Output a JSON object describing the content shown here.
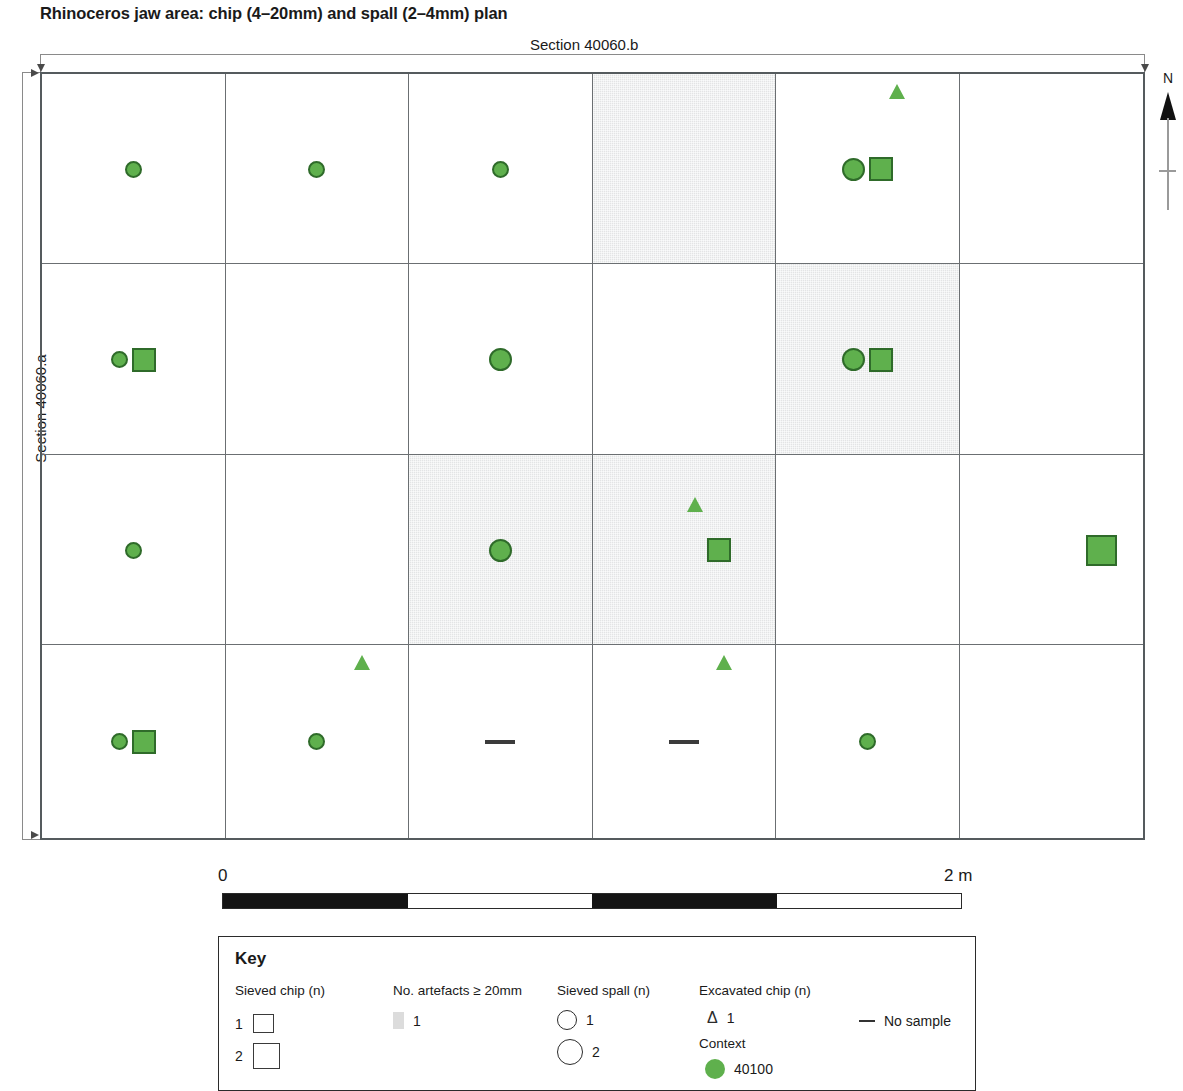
{
  "title": "Rhinoceros jaw area: chip (4–20mm) and spall (2–4mm) plan",
  "section_top_label": "Section 40060.b",
  "section_left_label": "Section 40060.a",
  "north": {
    "label": "N",
    "icon": "north-arrow-icon"
  },
  "scale": {
    "min_label": "0",
    "max_label": "2 m",
    "segments": [
      "dark",
      "light",
      "dark",
      "light"
    ]
  },
  "colors": {
    "context_green": "#5fb04d",
    "symbol_outline": "#2f6b2a",
    "shaded_cell": "#e3e4e5",
    "grid_line": "#6b6f72"
  },
  "chart_data": {
    "type": "table",
    "title": "Rhinoceros jaw area: chip (4–20mm) and spall (2–4mm) plan",
    "xlabel": "Section 40060.b",
    "ylabel": "Section 40060.a",
    "grid": {
      "rows": 4,
      "cols": 6
    },
    "legend_position": "bottom",
    "cells": [
      {
        "row": 1,
        "col": 1,
        "shaded": false,
        "symbols": [
          "circle-n1"
        ]
      },
      {
        "row": 1,
        "col": 2,
        "shaded": false,
        "symbols": [
          "circle-n1"
        ]
      },
      {
        "row": 1,
        "col": 3,
        "shaded": false,
        "symbols": [
          "circle-n1"
        ]
      },
      {
        "row": 1,
        "col": 4,
        "shaded": true,
        "symbols": []
      },
      {
        "row": 1,
        "col": 5,
        "shaded": false,
        "symbols": [
          "circle-n2",
          "square-n2",
          "triangle-n1"
        ]
      },
      {
        "row": 1,
        "col": 6,
        "shaded": false,
        "symbols": []
      },
      {
        "row": 2,
        "col": 1,
        "shaded": false,
        "symbols": [
          "circle-n1",
          "square-n2"
        ]
      },
      {
        "row": 2,
        "col": 2,
        "shaded": false,
        "symbols": []
      },
      {
        "row": 2,
        "col": 3,
        "shaded": false,
        "symbols": [
          "circle-n2"
        ]
      },
      {
        "row": 2,
        "col": 4,
        "shaded": false,
        "symbols": []
      },
      {
        "row": 2,
        "col": 5,
        "shaded": true,
        "symbols": [
          "circle-n2",
          "square-n2"
        ]
      },
      {
        "row": 2,
        "col": 6,
        "shaded": false,
        "symbols": []
      },
      {
        "row": 3,
        "col": 1,
        "shaded": false,
        "symbols": [
          "circle-n1"
        ]
      },
      {
        "row": 3,
        "col": 2,
        "shaded": false,
        "symbols": []
      },
      {
        "row": 3,
        "col": 3,
        "shaded": true,
        "symbols": [
          "circle-n2"
        ]
      },
      {
        "row": 3,
        "col": 4,
        "shaded": true,
        "symbols": [
          "triangle-n1",
          "square-n2"
        ]
      },
      {
        "row": 3,
        "col": 5,
        "shaded": false,
        "symbols": []
      },
      {
        "row": 3,
        "col": 6,
        "shaded": false,
        "symbols": [
          "square-n3"
        ]
      },
      {
        "row": 4,
        "col": 1,
        "shaded": false,
        "symbols": [
          "circle-n1",
          "square-n2"
        ]
      },
      {
        "row": 4,
        "col": 2,
        "shaded": false,
        "symbols": [
          "triangle-n1",
          "circle-n1"
        ]
      },
      {
        "row": 4,
        "col": 3,
        "shaded": false,
        "symbols": [
          "dash-no-sample"
        ]
      },
      {
        "row": 4,
        "col": 4,
        "shaded": false,
        "symbols": [
          "triangle-n1",
          "dash-no-sample"
        ]
      },
      {
        "row": 4,
        "col": 5,
        "shaded": false,
        "symbols": [
          "circle-n1"
        ]
      },
      {
        "row": 4,
        "col": 6,
        "shaded": false,
        "symbols": []
      }
    ]
  },
  "key": {
    "title": "Key",
    "columns": [
      {
        "header": "Sieved chip (n)",
        "items": [
          {
            "label": "1",
            "symbol": "open-square-small"
          },
          {
            "label": "2",
            "symbol": "open-square-large"
          }
        ]
      },
      {
        "header": "No. artefacts ≥ 20mm",
        "items": [
          {
            "label": "1",
            "symbol": "grey-swatch"
          }
        ]
      },
      {
        "header": "Sieved spall (n)",
        "items": [
          {
            "label": "1",
            "symbol": "open-circle-small"
          },
          {
            "label": "2",
            "symbol": "open-circle-large"
          }
        ]
      },
      {
        "header": "Excavated chip (n)",
        "items": [
          {
            "label": "1",
            "symbol": "open-triangle"
          }
        ],
        "sub_header": "Context",
        "sub_items": [
          {
            "label": "40100",
            "symbol": "green-circle"
          }
        ]
      },
      {
        "header": "",
        "items": [
          {
            "label": "No sample",
            "symbol": "dash"
          }
        ]
      }
    ]
  }
}
